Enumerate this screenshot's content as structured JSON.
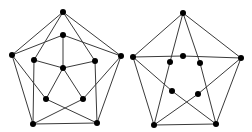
{
  "diagram": {
    "type": "graph-drawings",
    "edge_color": "#3a3a3a",
    "node_color": "#000000",
    "node_radius": 3,
    "graphs": [
      {
        "name": "left-graph",
        "nodes": [
          {
            "id": "o_top",
            "x": 63,
            "y": 12
          },
          {
            "id": "o_left",
            "x": 12,
            "y": 55
          },
          {
            "id": "o_right",
            "x": 121,
            "y": 56
          },
          {
            "id": "o_bl",
            "x": 33,
            "y": 124
          },
          {
            "id": "o_br",
            "x": 97,
            "y": 123
          },
          {
            "id": "i_top",
            "x": 63,
            "y": 35
          },
          {
            "id": "i_left",
            "x": 34,
            "y": 60
          },
          {
            "id": "i_right",
            "x": 95,
            "y": 61
          },
          {
            "id": "i_center",
            "x": 63,
            "y": 68
          },
          {
            "id": "i_bl",
            "x": 46,
            "y": 99
          },
          {
            "id": "i_br",
            "x": 83,
            "y": 99
          }
        ],
        "edges": [
          [
            "o_top",
            "o_left"
          ],
          [
            "o_top",
            "o_right"
          ],
          [
            "o_left",
            "o_bl"
          ],
          [
            "o_right",
            "o_br"
          ],
          [
            "o_bl",
            "o_br"
          ],
          [
            "o_top",
            "i_left"
          ],
          [
            "o_top",
            "i_right"
          ],
          [
            "o_left",
            "i_top"
          ],
          [
            "o_right",
            "i_top"
          ],
          [
            "o_left",
            "i_bl"
          ],
          [
            "o_right",
            "i_br"
          ],
          [
            "i_left",
            "o_bl"
          ],
          [
            "i_right",
            "o_br"
          ],
          [
            "i_top",
            "i_center"
          ],
          [
            "i_left",
            "i_center"
          ],
          [
            "i_right",
            "i_center"
          ],
          [
            "i_center",
            "i_bl"
          ],
          [
            "i_center",
            "i_br"
          ],
          [
            "i_bl",
            "o_br"
          ],
          [
            "i_br",
            "o_bl"
          ]
        ]
      },
      {
        "name": "right-graph",
        "nodes": [
          {
            "id": "o_top",
            "x": 183,
            "y": 13
          },
          {
            "id": "o_left",
            "x": 133,
            "y": 57
          },
          {
            "id": "o_right",
            "x": 241,
            "y": 58
          },
          {
            "id": "o_bl",
            "x": 154,
            "y": 125
          },
          {
            "id": "o_br",
            "x": 216,
            "y": 124
          },
          {
            "id": "i_top",
            "x": 183,
            "y": 56
          },
          {
            "id": "i_ul",
            "x": 170,
            "y": 62
          },
          {
            "id": "i_ur",
            "x": 200,
            "y": 63
          },
          {
            "id": "i_ll",
            "x": 172,
            "y": 91
          },
          {
            "id": "i_lr",
            "x": 198,
            "y": 94
          }
        ],
        "edges": [
          [
            "o_top",
            "o_left"
          ],
          [
            "o_top",
            "o_right"
          ],
          [
            "o_left",
            "o_bl"
          ],
          [
            "o_right",
            "o_br"
          ],
          [
            "o_bl",
            "o_br"
          ],
          [
            "o_left",
            "i_top"
          ],
          [
            "i_top",
            "o_right"
          ],
          [
            "o_top",
            "i_ul"
          ],
          [
            "i_ul",
            "o_bl"
          ],
          [
            "o_top",
            "i_ur"
          ],
          [
            "i_ur",
            "o_br"
          ],
          [
            "o_left",
            "i_ll"
          ],
          [
            "i_ll",
            "o_br"
          ],
          [
            "o_right",
            "i_lr"
          ],
          [
            "i_lr",
            "o_bl"
          ]
        ]
      }
    ]
  }
}
